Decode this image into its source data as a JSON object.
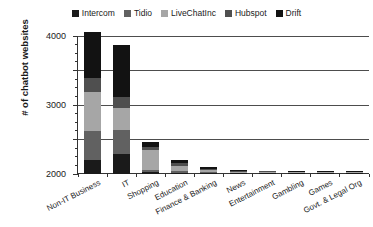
{
  "chart_data": {
    "type": "bar",
    "subtype": "stacked-bar",
    "title": "",
    "xlabel": "",
    "ylabel": "# of chatbot websites",
    "ylim": [
      0,
      4000
    ],
    "ytick_labels": [
      "0",
      "1000",
      "2000",
      "3000",
      "4000"
    ],
    "ytick_values": [
      0,
      1000,
      2000,
      3000,
      4000
    ],
    "ytick_minor_step": 250,
    "grid": true,
    "grid_axis": "y",
    "legend_position": "top-center",
    "categories": [
      "Non-IT Business",
      "IT",
      "Shopping",
      "Education",
      "Finance & Banking",
      "News",
      "Entertainment",
      "Gambling",
      "Games",
      "Govt. & Legal Org"
    ],
    "series": [
      {
        "name": "Intercom",
        "color": "#1a1a1a",
        "values": [
          420,
          590,
          60,
          35,
          20,
          12,
          10,
          8,
          6,
          4
        ]
      },
      {
        "name": "Tidio",
        "color": "#616161",
        "values": [
          830,
          690,
          70,
          45,
          30,
          20,
          14,
          10,
          8,
          6
        ]
      },
      {
        "name": "LiveChatInc",
        "color": "#a6a6a6",
        "values": [
          1120,
          620,
          570,
          160,
          55,
          30,
          22,
          16,
          12,
          9
        ]
      },
      {
        "name": "Hubspot",
        "color": "#4f4f4f",
        "values": [
          420,
          320,
          95,
          70,
          45,
          22,
          16,
          12,
          9,
          7
        ]
      },
      {
        "name": "Drift",
        "color": "#121212",
        "values": [
          1320,
          1530,
          135,
          100,
          60,
          30,
          22,
          16,
          11,
          8
        ]
      }
    ],
    "totals": [
      4110,
      3750,
      930,
      410,
      210,
      114,
      84,
      62,
      46,
      34
    ]
  },
  "legend": {
    "items": [
      {
        "label": "Intercom",
        "swatch_color": "#1a1a1a"
      },
      {
        "label": "Tidio",
        "swatch_color": "#616161"
      },
      {
        "label": "LiveChatInc",
        "swatch_color": "#a6a6a6"
      },
      {
        "label": "Hubspot",
        "swatch_color": "#4f4f4f"
      },
      {
        "label": "Drift",
        "swatch_color": "#121212"
      }
    ]
  },
  "axes": {
    "y_title": "# of chatbot websites"
  }
}
